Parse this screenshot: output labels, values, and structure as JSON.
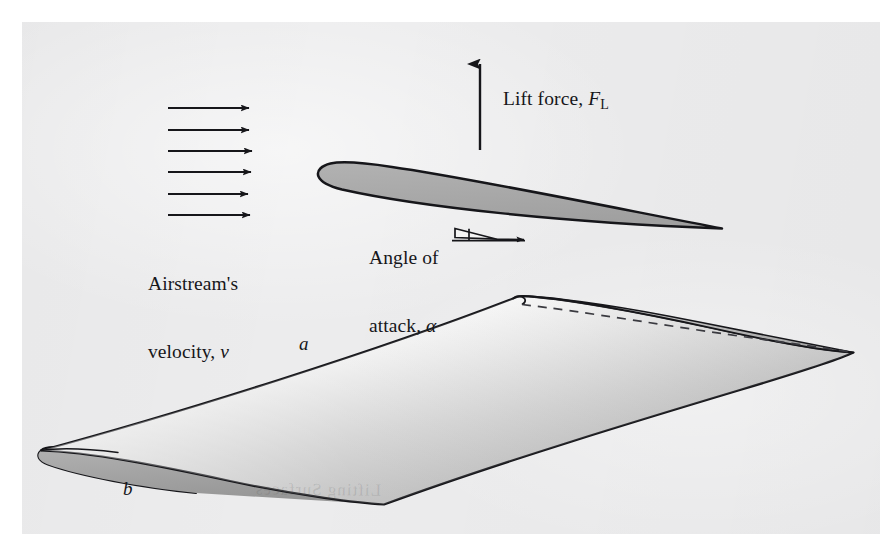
{
  "figure": {
    "background_color": "#ffffff",
    "panel_color": "#ececed",
    "ink_color": "#16161a",
    "airfoil_fill": "#a9a9a9",
    "wing_underside_fill": "#9c9c9c"
  },
  "labels": {
    "airstream_line1": "Airstream's",
    "airstream_line2_prefix": "velocity, ",
    "airstream_symbol": "v",
    "lift_prefix": "Lift force, ",
    "lift_symbol": "F",
    "lift_subscript": "L",
    "aoa_line1": "Angle of",
    "aoa_line2_prefix": "attack, ",
    "aoa_symbol": "α",
    "span_label": "a",
    "chord_label": "b"
  },
  "ghost_text": "Lifting Surfaces",
  "diagram_data": {
    "type": "technical-illustration",
    "subject": "airfoil cross-section and three-dimensional rectangular wing",
    "annotations": [
      {
        "name": "airstream-arrows",
        "kind": "arrow-array",
        "count": 6,
        "direction": "left-to-right",
        "meaning": "free-stream air velocity v",
        "x_start": 168,
        "x_end": 250,
        "y_values": [
          108,
          130,
          151,
          172,
          194,
          215
        ]
      },
      {
        "name": "lift-arrow",
        "kind": "arrow",
        "direction": "upward",
        "meaning": "lift force F_L",
        "x": 480,
        "y_tail": 150,
        "y_head": 63
      },
      {
        "name": "angle-of-attack-wedge",
        "kind": "wedge-with-reference-line",
        "meaning": "angle alpha between chord line and free-stream direction",
        "apex_x": 496,
        "apex_y": 239,
        "base_x": 455,
        "reference_line_y": 240
      }
    ],
    "airfoil_section": {
      "leading_edge": [
        318,
        168
      ],
      "trailing_edge": [
        722,
        228
      ],
      "chord_px": 409,
      "max_thickness_px": 22,
      "orientation": "nose-high, trailing edge lower-right"
    },
    "wing_3d": {
      "left_tip_leading_edge": [
        41,
        450
      ],
      "left_tip_trailing_edge": [
        196,
        493
      ],
      "right_tip_leading_edge": [
        520,
        296
      ],
      "right_tip_trailing_edge": [
        853,
        352
      ],
      "span_label_at": [
        306,
        344
      ],
      "chord_label_at": [
        130,
        489
      ],
      "hidden_edge": "dashed line from right-tip leading edge to right-tip trailing edge"
    }
  }
}
